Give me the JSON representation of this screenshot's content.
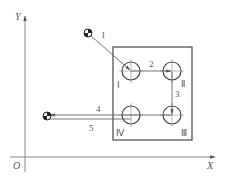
{
  "axes": {
    "origin_label": "O",
    "x_label": "X",
    "y_label": "Y"
  },
  "workpiece": {
    "holes": [
      {
        "id": "I",
        "label": "Ⅰ"
      },
      {
        "id": "II",
        "label": "Ⅱ"
      },
      {
        "id": "III",
        "label": "Ⅲ"
      },
      {
        "id": "IV",
        "label": "Ⅳ"
      }
    ]
  },
  "path": {
    "segments": [
      {
        "label": "1"
      },
      {
        "label": "2"
      },
      {
        "label": "3"
      },
      {
        "label": "4"
      },
      {
        "label": "5"
      }
    ]
  },
  "colors": {
    "line": "#777777",
    "text": "#555555",
    "tool": "#222222"
  }
}
